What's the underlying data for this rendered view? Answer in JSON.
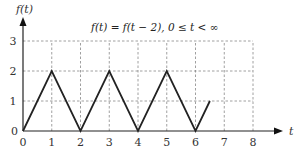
{
  "chart_data": {
    "type": "line",
    "title": "f(t) = f(t − 2), 0 ≤ t < ∞",
    "xlabel": "t",
    "ylabel": "f(t)",
    "xlim": [
      0,
      8
    ],
    "ylim": [
      0,
      3
    ],
    "grid": true,
    "grid_style": "dashed",
    "x_ticks": [
      "0",
      "1",
      "2",
      "3",
      "4",
      "5",
      "6",
      "7",
      "8"
    ],
    "y_ticks": [
      "0",
      "1",
      "2",
      "3"
    ],
    "series": [
      {
        "name": "f(t)",
        "x": [
          0,
          1,
          2,
          3,
          4,
          5,
          6,
          6.5
        ],
        "y": [
          0,
          2,
          0,
          2,
          0,
          2,
          0,
          1
        ]
      }
    ],
    "legend": null
  },
  "labels": {
    "y_axis": "f(t)",
    "x_axis": "t",
    "title": "f(t) = f(t − 2), 0 ≤ t < ∞",
    "origin": "0"
  }
}
